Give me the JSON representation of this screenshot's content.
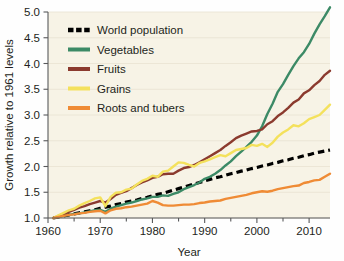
{
  "chart_data": {
    "type": "line",
    "title": "",
    "xlabel": "Year",
    "ylabel": "Growth relative to 1961 levels",
    "xlim": [
      1960,
      2014
    ],
    "ylim": [
      1.0,
      5.0
    ],
    "grid": true,
    "legend_position": "top-left",
    "x_ticks": [
      1960,
      1970,
      1980,
      1990,
      2000,
      2010
    ],
    "x_tick_labels": [
      "1960",
      "1970",
      "1980",
      "1990",
      "2000",
      "2010"
    ],
    "x_minor_tick_interval": 5,
    "y_ticks": [
      1.0,
      1.5,
      2.0,
      2.5,
      3.0,
      3.5,
      4.0,
      4.5,
      5.0
    ],
    "y_tick_labels": [
      "1.0",
      "1.5",
      "2.0",
      "2.5",
      "3.0",
      "3.5",
      "4.0",
      "4.5",
      "5.0"
    ],
    "x": [
      1961,
      1962,
      1963,
      1964,
      1965,
      1966,
      1967,
      1968,
      1969,
      1970,
      1971,
      1972,
      1973,
      1974,
      1975,
      1976,
      1977,
      1978,
      1979,
      1980,
      1981,
      1982,
      1983,
      1984,
      1985,
      1986,
      1987,
      1988,
      1989,
      1990,
      1991,
      1992,
      1993,
      1994,
      1995,
      1996,
      1997,
      1998,
      1999,
      2000,
      2001,
      2002,
      2003,
      2004,
      2005,
      2006,
      2007,
      2008,
      2009,
      2010,
      2011,
      2012,
      2013,
      2014
    ],
    "series": [
      {
        "name": "World population",
        "color": "#000000",
        "style": "dashed",
        "values": [
          1.0,
          1.02,
          1.04,
          1.06,
          1.08,
          1.1,
          1.12,
          1.14,
          1.16,
          1.19,
          1.21,
          1.23,
          1.26,
          1.28,
          1.31,
          1.33,
          1.35,
          1.38,
          1.4,
          1.43,
          1.46,
          1.48,
          1.51,
          1.54,
          1.57,
          1.6,
          1.63,
          1.66,
          1.69,
          1.72,
          1.75,
          1.78,
          1.8,
          1.83,
          1.86,
          1.88,
          1.91,
          1.93,
          1.96,
          1.98,
          2.01,
          2.03,
          2.06,
          2.08,
          2.11,
          2.13,
          2.16,
          2.18,
          2.21,
          2.23,
          2.26,
          2.28,
          2.3,
          2.32
        ]
      },
      {
        "name": "Vegetables",
        "color": "#3c8a66",
        "style": "solid",
        "values": [
          1.0,
          1.02,
          1.04,
          1.06,
          1.08,
          1.09,
          1.11,
          1.13,
          1.15,
          1.16,
          1.12,
          1.18,
          1.22,
          1.25,
          1.28,
          1.3,
          1.33,
          1.36,
          1.38,
          1.41,
          1.41,
          1.44,
          1.43,
          1.47,
          1.5,
          1.56,
          1.6,
          1.64,
          1.69,
          1.76,
          1.8,
          1.86,
          1.93,
          2.02,
          2.1,
          2.2,
          2.29,
          2.38,
          2.48,
          2.6,
          2.78,
          3.02,
          3.22,
          3.45,
          3.6,
          3.78,
          3.95,
          4.1,
          4.22,
          4.38,
          4.58,
          4.76,
          4.92,
          5.09
        ]
      },
      {
        "name": "Fruits",
        "color": "#8b3a2e",
        "style": "solid",
        "values": [
          1.0,
          1.04,
          1.08,
          1.12,
          1.16,
          1.2,
          1.23,
          1.27,
          1.3,
          1.33,
          1.3,
          1.37,
          1.45,
          1.49,
          1.52,
          1.58,
          1.64,
          1.69,
          1.73,
          1.78,
          1.8,
          1.85,
          1.86,
          1.86,
          1.92,
          1.97,
          1.99,
          2.03,
          2.08,
          2.14,
          2.2,
          2.26,
          2.32,
          2.4,
          2.47,
          2.55,
          2.6,
          2.64,
          2.68,
          2.69,
          2.72,
          2.82,
          2.88,
          2.98,
          3.05,
          3.14,
          3.24,
          3.3,
          3.42,
          3.48,
          3.58,
          3.66,
          3.78,
          3.86
        ]
      },
      {
        "name": "Grains",
        "color": "#f4e15c",
        "style": "solid",
        "values": [
          1.0,
          1.05,
          1.1,
          1.15,
          1.18,
          1.24,
          1.29,
          1.33,
          1.38,
          1.4,
          1.23,
          1.41,
          1.49,
          1.5,
          1.55,
          1.57,
          1.65,
          1.72,
          1.76,
          1.82,
          1.8,
          1.9,
          1.92,
          2.0,
          2.08,
          2.07,
          2.03,
          2.0,
          2.07,
          2.1,
          2.14,
          2.18,
          2.22,
          2.2,
          2.26,
          2.32,
          2.34,
          2.36,
          2.42,
          2.4,
          2.44,
          2.38,
          2.46,
          2.58,
          2.66,
          2.72,
          2.8,
          2.78,
          2.84,
          2.92,
          2.96,
          3.0,
          3.1,
          3.2
        ]
      },
      {
        "name": "Roots and tubers",
        "color": "#ef8b35",
        "style": "solid",
        "values": [
          1.0,
          1.02,
          1.04,
          1.06,
          1.07,
          1.09,
          1.1,
          1.12,
          1.13,
          1.14,
          1.09,
          1.15,
          1.18,
          1.19,
          1.21,
          1.22,
          1.24,
          1.26,
          1.28,
          1.33,
          1.3,
          1.25,
          1.24,
          1.24,
          1.25,
          1.26,
          1.26,
          1.27,
          1.29,
          1.3,
          1.32,
          1.33,
          1.34,
          1.37,
          1.39,
          1.41,
          1.43,
          1.45,
          1.48,
          1.5,
          1.52,
          1.51,
          1.53,
          1.56,
          1.58,
          1.6,
          1.62,
          1.63,
          1.68,
          1.7,
          1.73,
          1.74,
          1.8,
          1.86
        ]
      }
    ]
  },
  "legend": {
    "items": [
      {
        "label": "World population",
        "color": "#000000",
        "style": "dashed"
      },
      {
        "label": "Vegetables",
        "color": "#3c8a66",
        "style": "solid"
      },
      {
        "label": "Fruits",
        "color": "#8b3a2e",
        "style": "solid"
      },
      {
        "label": "Grains",
        "color": "#f4e15c",
        "style": "solid"
      },
      {
        "label": "Roots and tubers",
        "color": "#ef8b35",
        "style": "solid"
      }
    ]
  },
  "style": {
    "plot_background": "#f7f3e6",
    "page_background": "#fefefe",
    "axis_color": "#58595b",
    "grid_color": "#e8e2d2",
    "text_color": "#231f20"
  }
}
